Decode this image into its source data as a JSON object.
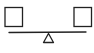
{
  "diagram": {
    "type": "balance-scale",
    "stroke_color": "#222222",
    "background": "#ffffff",
    "left_item": {
      "shape": "square"
    },
    "right_item": {
      "shape": "square"
    },
    "beam": {
      "state": "level"
    },
    "fulcrum": {
      "shape": "triangle"
    }
  }
}
